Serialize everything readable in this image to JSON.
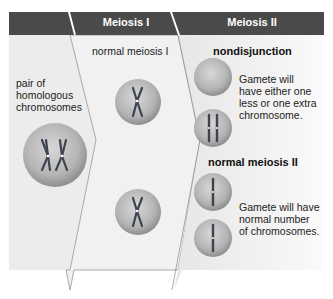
{
  "headers": {
    "stage0": "",
    "meiosis1": "Meiosis I",
    "meiosis2": "Meiosis II"
  },
  "labels": {
    "pair": [
      "pair of",
      "homologous",
      "chromosomes"
    ],
    "normal_meiosis_1": "normal meiosis I",
    "nondisjunction": "nondisjunction",
    "nondisjunction_desc": [
      "Gamete will",
      "have either one",
      "less or one extra",
      "chromosome."
    ],
    "normal_meiosis_2": "normal meiosis II",
    "normal_desc": [
      "Gamete will have",
      "normal number",
      "of chromosomes."
    ]
  },
  "colors": {
    "header": "#4a4a4a",
    "panel": "#ececec",
    "cell": "#b8b8b8",
    "chromosome": "#3d4450"
  }
}
